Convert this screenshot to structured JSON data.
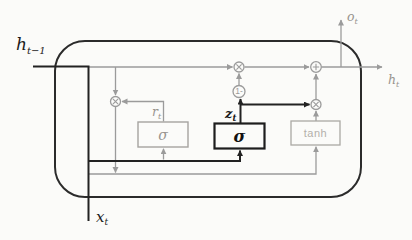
{
  "labels": {
    "hidden_prev": {
      "base": "h",
      "sub": "t−1"
    },
    "input_x": {
      "base": "x",
      "sub": "t"
    },
    "output_o": {
      "base": "o",
      "sub": "t"
    },
    "hidden_next": {
      "base": "h",
      "sub": "t"
    },
    "reset_gate": {
      "base": "r",
      "sub": "t"
    },
    "update_gate": {
      "base": "z",
      "sub": "t"
    }
  },
  "nodes": {
    "reset_sigma": "σ",
    "update_sigma": "σ",
    "candidate_tanh": "tanh",
    "one_minus": "1-"
  },
  "colors": {
    "ink_black": "#222222",
    "line_gray": "#9b9b9b",
    "box_gray": "#a5a3a0",
    "text_gray": "#98948e",
    "background": "#fbfbf9"
  }
}
